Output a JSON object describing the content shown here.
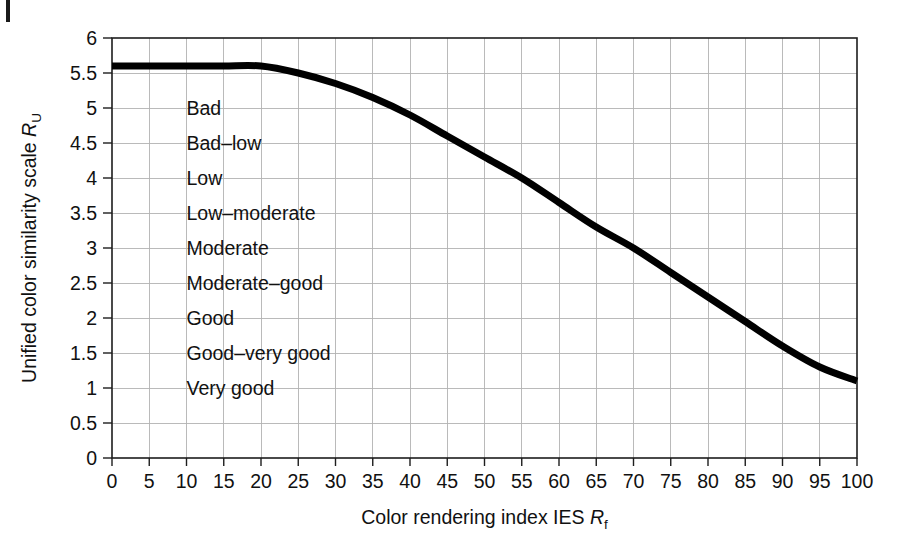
{
  "figure": {
    "background_color": "#ffffff",
    "curve_color": "#000000",
    "grid_color": "#b3b3b3",
    "axis_color": "#1d1d1d",
    "text_color": "#111111"
  },
  "chart_data": {
    "type": "line",
    "title": "",
    "subtitle": "",
    "xlabel_parts": {
      "lead": "Color rendering index IES ",
      "symbol": "R",
      "subscript": "f"
    },
    "ylabel_parts": {
      "lead": "Unified color similarity scale ",
      "symbol": "R",
      "subscript": "U"
    },
    "xlabel": "Color rendering index IES Rf",
    "ylabel": "Unified color similarity scale RU",
    "xlim": [
      0,
      100
    ],
    "ylim": [
      0,
      6
    ],
    "grid": true,
    "legend": "none",
    "xticks": [
      0,
      5,
      10,
      15,
      20,
      25,
      30,
      35,
      40,
      45,
      50,
      55,
      60,
      65,
      70,
      75,
      80,
      85,
      90,
      95,
      100
    ],
    "xticklabels": [
      "0",
      "5",
      "10",
      "15",
      "20",
      "25",
      "30",
      "35",
      "40",
      "45",
      "50",
      "55",
      "60",
      "65",
      "70",
      "75",
      "80",
      "85",
      "90",
      "95",
      "100"
    ],
    "yticks": [
      0,
      0.5,
      1,
      1.5,
      2,
      2.5,
      3,
      3.5,
      4,
      4.5,
      5,
      5.5,
      6
    ],
    "yticklabels": [
      "0",
      "0.5",
      "1",
      "1.5",
      "2",
      "2.5",
      "3",
      "3.5",
      "4",
      "4.5",
      "5",
      "5.5",
      "6"
    ],
    "series": [
      {
        "name": "Unified color similarity scale",
        "x": [
          0,
          5,
          10,
          15,
          20,
          25,
          30,
          35,
          40,
          45,
          50,
          55,
          60,
          65,
          70,
          75,
          80,
          85,
          90,
          95,
          100
        ],
        "values": [
          5.6,
          5.6,
          5.6,
          5.6,
          5.6,
          5.5,
          5.35,
          5.15,
          4.9,
          4.6,
          4.3,
          4.0,
          3.65,
          3.3,
          3.0,
          2.65,
          2.3,
          1.95,
          1.6,
          1.3,
          1.1
        ]
      }
    ],
    "annotations": [
      {
        "text": "Bad",
        "x": 10,
        "y": 5.0
      },
      {
        "text": "Bad–low",
        "x": 10,
        "y": 4.5
      },
      {
        "text": "Low",
        "x": 10,
        "y": 4.0
      },
      {
        "text": "Low–moderate",
        "x": 10,
        "y": 3.5
      },
      {
        "text": "Moderate",
        "x": 10,
        "y": 3.0
      },
      {
        "text": "Moderate–good",
        "x": 10,
        "y": 2.5
      },
      {
        "text": "Good",
        "x": 10,
        "y": 2.0
      },
      {
        "text": "Good–very good",
        "x": 10,
        "y": 1.5
      },
      {
        "text": "Very good",
        "x": 10,
        "y": 1.0
      }
    ]
  }
}
